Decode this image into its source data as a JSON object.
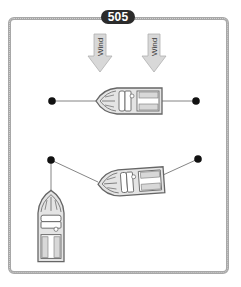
{
  "figure": {
    "number_badge": "505",
    "wind_arrows": [
      {
        "label": "Wind",
        "x": 100,
        "y_top": 34
      },
      {
        "label": "Wind",
        "x": 154,
        "y_top": 34
      }
    ],
    "colors": {
      "frame": "#a8a8a8",
      "badge_bg": "#2b2b2b",
      "arrow_fill": "#d8d8d8",
      "boat_fill": "#e4e4e4",
      "boat_stroke": "#666666",
      "buoy": "#111111"
    },
    "scenes": [
      {
        "name": "top-mooring",
        "boat_orientation": "bow-left",
        "buoys": 2
      },
      {
        "name": "middle-mooring",
        "boat_orientation": "bow-left-tilted",
        "buoys": 2
      },
      {
        "name": "approaching-boat",
        "boat_orientation": "bow-up"
      }
    ]
  }
}
